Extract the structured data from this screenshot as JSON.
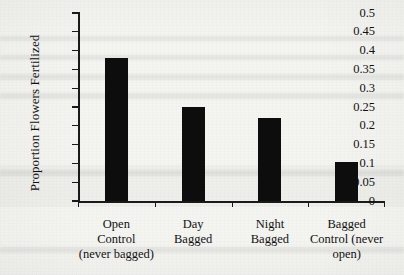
{
  "chart_data": {
    "type": "bar",
    "title": "",
    "xlabel": "",
    "ylabel": "Proportion Flowers Fertilized",
    "ylim": [
      0,
      0.5
    ],
    "ytick_step": 0.05,
    "ytick_labels": [
      "0.5",
      "0.45",
      "0.4",
      "0.35",
      "0.3",
      "0.25",
      "0.2",
      "0.15",
      "0.1",
      "0.05",
      "0"
    ],
    "ytick_values": [
      0.5,
      0.45,
      0.4,
      0.35,
      0.3,
      0.25,
      0.2,
      0.15,
      0.1,
      0.05,
      0
    ],
    "grid": false,
    "legend": false,
    "bar_color": "#0d0d0d",
    "categories": [
      "Open Control (never bagged)",
      "Day Bagged",
      "Night Bagged",
      "Bagged Control (never open)"
    ],
    "category_label_lines": [
      [
        "Open",
        "Control",
        "(never bagged)"
      ],
      [
        "Day",
        "Bagged"
      ],
      [
        "Night",
        "Bagged"
      ],
      [
        "Bagged",
        "Control (never",
        "open)"
      ]
    ],
    "values": [
      0.38,
      0.25,
      0.22,
      0.105
    ]
  }
}
